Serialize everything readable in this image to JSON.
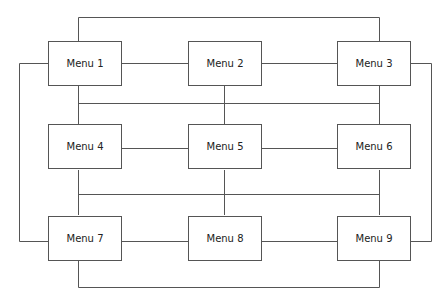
{
  "diagram": {
    "type": "menu-navigation-map",
    "line_color": "#555555",
    "nodes": [
      {
        "id": "menu1",
        "label": "Menu 1"
      },
      {
        "id": "menu2",
        "label": "Menu 2"
      },
      {
        "id": "menu3",
        "label": "Menu 3"
      },
      {
        "id": "menu4",
        "label": "Menu 4"
      },
      {
        "id": "menu5",
        "label": "Menu 5"
      },
      {
        "id": "menu6",
        "label": "Menu 6"
      },
      {
        "id": "menu7",
        "label": "Menu 7"
      },
      {
        "id": "menu8",
        "label": "Menu 8"
      },
      {
        "id": "menu9",
        "label": "Menu 9"
      }
    ],
    "edges": [
      [
        "menu1",
        "menu2"
      ],
      [
        "menu2",
        "menu3"
      ],
      [
        "menu4",
        "menu5"
      ],
      [
        "menu5",
        "menu6"
      ],
      [
        "menu7",
        "menu8"
      ],
      [
        "menu8",
        "menu9"
      ],
      [
        "menu1",
        "menu3"
      ],
      [
        "menu1",
        "menu7"
      ],
      [
        "menu3",
        "menu9"
      ],
      [
        "menu7",
        "menu9"
      ],
      [
        "menu1",
        "menu4"
      ],
      [
        "menu2",
        "menu5"
      ],
      [
        "menu3",
        "menu6"
      ],
      [
        "menu4",
        "menu7"
      ],
      [
        "menu5",
        "menu8"
      ],
      [
        "menu6",
        "menu9"
      ]
    ]
  }
}
